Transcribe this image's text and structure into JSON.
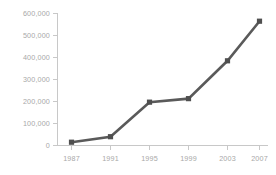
{
  "chart_data": {
    "type": "line",
    "title": "",
    "subtitle": "",
    "xlabel": "",
    "ylabel": "",
    "categories": [
      "1987",
      "1991",
      "1995",
      "1999",
      "2003",
      "2007"
    ],
    "x": [
      1987,
      1991,
      1995,
      1999,
      2003,
      2007
    ],
    "values": [
      15000,
      40000,
      197000,
      213000,
      385000,
      565000
    ],
    "series": [
      {
        "name": "",
        "values": [
          15000,
          40000,
          197000,
          213000,
          385000,
          565000
        ]
      }
    ],
    "ylim": [
      0,
      600000
    ],
    "yticks": [
      0,
      100000,
      200000,
      300000,
      400000,
      500000,
      600000
    ],
    "ytick_labels": [
      "0",
      "100,000",
      "200,000",
      "300,000",
      "400,000",
      "500,000",
      "600,000"
    ],
    "xtick_labels": [
      "1987",
      "1991",
      "1995",
      "1999",
      "2003",
      "2007"
    ],
    "grid": false,
    "legend": false,
    "legend_position": "none",
    "marker": "square",
    "colors": {
      "line": "#5a5a5a",
      "marker": "#4f4f4f",
      "axis": "#c8c8c8",
      "tick_label": "#a8a8a8",
      "background": "#ffffff"
    }
  }
}
